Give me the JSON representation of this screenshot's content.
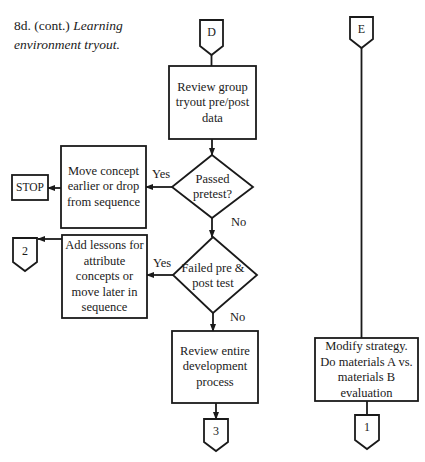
{
  "caption": {
    "number": "8d. (cont.)",
    "title_line1": "Learning",
    "title_line2": "environment tryout."
  },
  "connectors": {
    "entry_d": "D",
    "entry_e": "E",
    "exit_2": "2",
    "exit_3": "3",
    "exit_1": "1"
  },
  "boxes": {
    "review_group": "Review group tryout pre/post data",
    "move_concept": "Move concept earlier or drop from sequence",
    "stop": "STOP",
    "add_lessons": "Add lessons for attribute concepts or move later in sequence",
    "review_entire": "Review entire development process",
    "modify_strategy": "Modify strategy. Do materials A vs. materials B evaluation"
  },
  "decisions": {
    "passed_pretest": "Passed pretest?",
    "failed_pre_post": "Failed pre & post test"
  },
  "labels": {
    "yes1": "Yes",
    "no1": "No",
    "yes2": "Yes",
    "no2": "No"
  }
}
